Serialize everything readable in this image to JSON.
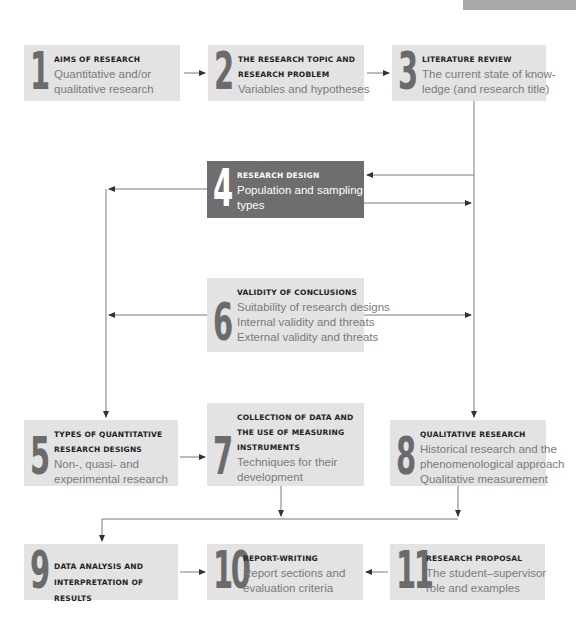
{
  "colors": {
    "box_bg": "#e3e3e3",
    "box_highlight_bg": "#6e6e6e",
    "numeral": "#6b6b6b",
    "line": "#707070",
    "corner_bar": "#a8a8a8"
  },
  "boxes": [
    {
      "number": "1",
      "title": "AIMS OF RESEARCH",
      "lines": [
        "Quantitative and/or",
        "qualitative research"
      ]
    },
    {
      "number": "2",
      "title_lines": [
        "THE RESEARCH TOPIC AND",
        "RESEARCH PROBLEM"
      ],
      "lines": [
        "Variables and hypotheses"
      ]
    },
    {
      "number": "3",
      "title": "LITERATURE REVIEW",
      "lines": [
        "The current state of know-",
        "ledge (and research title)"
      ]
    },
    {
      "number": "4",
      "title": "RESEARCH DESIGN",
      "lines": [
        "Population and sampling",
        "types"
      ],
      "highlighted": true
    },
    {
      "number": "5",
      "title_lines": [
        "TYPES OF QUANTITATIVE",
        "RESEARCH DESIGNS"
      ],
      "lines": [
        "Non-, quasi- and",
        "experimental research"
      ]
    },
    {
      "number": "6",
      "title": "VALIDITY OF CONCLUSIONS",
      "lines": [
        "Suitability of research designs",
        "Internal validity and threats",
        "External validity and threats"
      ]
    },
    {
      "number": "7",
      "title_lines": [
        "COLLECTION OF DATA AND",
        "THE USE OF MEASURING",
        "INSTRUMENTS"
      ],
      "lines": [
        "Techniques for their",
        "development"
      ]
    },
    {
      "number": "8",
      "title": "QUALITATIVE RESEARCH",
      "lines": [
        "Historical research and the",
        "phenomenological approach",
        "Qualitative measurement"
      ]
    },
    {
      "number": "9",
      "title_lines": [
        "DATA ANALYSIS AND",
        "INTERPRETATION OF RESULTS"
      ],
      "lines": []
    },
    {
      "number": "10",
      "title": "REPORT-WRITING",
      "lines": [
        "Report sections and",
        "evaluation criteria"
      ]
    },
    {
      "number": "11",
      "title": "RESEARCH PROPOSAL",
      "lines": [
        "The student–supervisor",
        "role and examples"
      ]
    }
  ]
}
